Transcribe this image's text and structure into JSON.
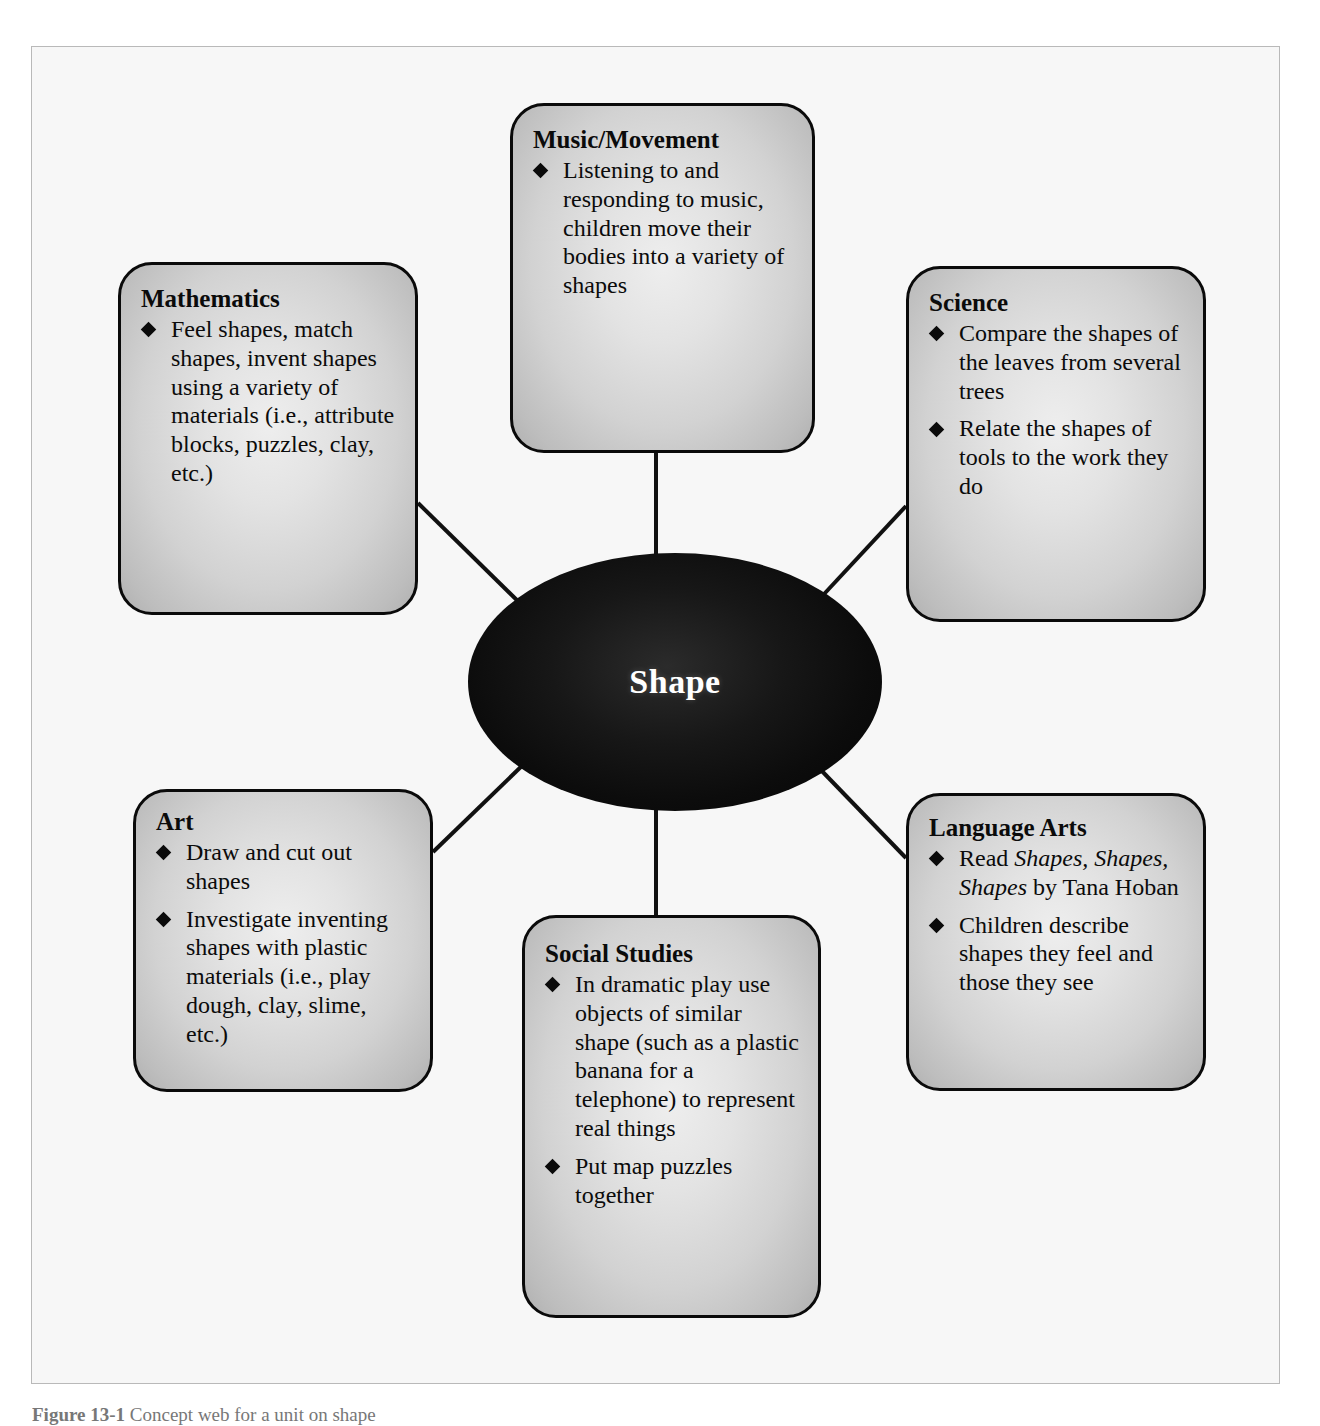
{
  "figure": {
    "center": {
      "label": "Shape"
    },
    "caption_prefix": "Figure 13-1",
    "caption_rest": " Concept web for a unit on shape",
    "colors": {
      "page_background": "#ffffff",
      "frame_background": "#f7f7f7",
      "frame_border": "#b9b9b9",
      "node_border": "#0a0a0a",
      "node_fill_light": "#eeeeee",
      "node_fill_dark": "#b0b0b0",
      "center_fill": "#0c0c0c",
      "center_text": "#ffffff",
      "text": "#0b0b0b",
      "connector": "#111111"
    },
    "nodes": [
      {
        "id": "music",
        "title": "Music/Movement",
        "items": [
          "Listening to and responding to music, children move their bodies into a variety of shapes"
        ]
      },
      {
        "id": "mathematics",
        "title": "Mathematics",
        "items": [
          "Feel shapes, match shapes, invent shapes using a variety of materials (i.e., attribute blocks, puzzles, clay, etc.)"
        ]
      },
      {
        "id": "science",
        "title": "Science",
        "items": [
          "Compare the shapes of the leaves from several trees",
          "Relate the shapes of tools to the work they do"
        ]
      },
      {
        "id": "art",
        "title": "Art",
        "items": [
          "Draw and cut out shapes",
          "Investigate inventing shapes with plastic materials (i.e., play dough, clay, slime, etc.)"
        ]
      },
      {
        "id": "social",
        "title": "Social Studies",
        "items": [
          "In dramatic play use objects of similar shape (such as a plastic banana for a telephone) to represent real things",
          "Put map puzzles together"
        ]
      },
      {
        "id": "language",
        "title": "Language Arts",
        "items_html": [
          "Read <i>Shapes, Shapes, Shapes</i> by Tana Hoban",
          "Children describe shapes they feel and those they see"
        ]
      }
    ]
  },
  "chart_data": {
    "type": "diagram",
    "subtype": "concept-web",
    "title": "Shape",
    "center": "Shape",
    "nodes": [
      "Music/Movement",
      "Mathematics",
      "Science",
      "Art",
      "Social Studies",
      "Language Arts"
    ],
    "edges": [
      {
        "from": "Shape",
        "to": "Music/Movement"
      },
      {
        "from": "Shape",
        "to": "Mathematics"
      },
      {
        "from": "Shape",
        "to": "Science"
      },
      {
        "from": "Shape",
        "to": "Art"
      },
      {
        "from": "Shape",
        "to": "Social Studies"
      },
      {
        "from": "Shape",
        "to": "Language Arts"
      }
    ]
  }
}
